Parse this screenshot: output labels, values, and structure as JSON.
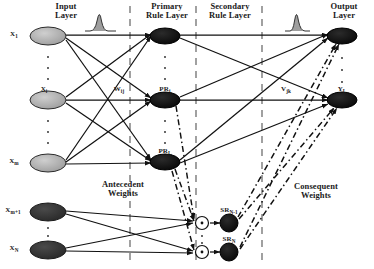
{
  "figure": {
    "type": "neural-network-architecture-diagram",
    "background": "#ffffff",
    "ink": "#111111",
    "size": {
      "width": 374,
      "height": 269
    }
  },
  "layer_titles": [
    {
      "id": "input",
      "label": "Input\nLayer",
      "x": 66,
      "y": 3
    },
    {
      "id": "primary-rule",
      "label": "Primary\nRule Layer",
      "x": 167,
      "y": 3
    },
    {
      "id": "secondary-rule",
      "label": "Secondary\nRule Layer",
      "x": 228,
      "y": 3
    },
    {
      "id": "output",
      "label": "Output\nLayer",
      "x": 344,
      "y": 3
    }
  ],
  "group_labels": [
    {
      "id": "antecedent-weights",
      "label": "Antecedent\nWeights",
      "x": 122,
      "y": 186
    },
    {
      "id": "consequent-weights",
      "label": "Consequent\nWeights",
      "x": 315,
      "y": 187
    }
  ],
  "weight_labels": [
    {
      "id": "w-ij",
      "base": "W",
      "sub": "ij",
      "x": 118,
      "y": 90
    },
    {
      "id": "v-jk",
      "base": "V",
      "sub": "jk",
      "x": 285,
      "y": 90
    }
  ],
  "nodes": {
    "input": [
      {
        "id": "x1",
        "base": "X",
        "sub": "1",
        "cx": 48,
        "cy": 36,
        "fill": "#a8a8a8"
      },
      {
        "id": "xi",
        "base": "X",
        "sub": "i",
        "cx": 48,
        "cy": 100,
        "fill": "#a8a8a8"
      },
      {
        "id": "xm",
        "base": "X",
        "sub": "m",
        "cx": 48,
        "cy": 163,
        "fill": "#a8a8a8"
      },
      {
        "id": "xm1",
        "base": "X",
        "sub": "m+1",
        "cx": 48,
        "cy": 212,
        "fill": "#3a3a3a"
      },
      {
        "id": "xn",
        "base": "X",
        "sub": "N",
        "cx": 48,
        "cy": 250,
        "fill": "#3a3a3a"
      }
    ],
    "primary_rule": [
      {
        "id": "pr1",
        "base": "PR",
        "sub": "1",
        "cx": 165,
        "cy": 36,
        "fill": "#0d0d0d",
        "label_shown": false
      },
      {
        "id": "prj",
        "base": "PR",
        "sub": "j",
        "cx": 165,
        "cy": 100,
        "fill": "#0d0d0d",
        "label_shown": true
      },
      {
        "id": "prl",
        "base": "PR",
        "sub": "L",
        "cx": 165,
        "cy": 162,
        "fill": "#0d0d0d",
        "label_shown": true
      }
    ],
    "product_operators": [
      {
        "id": "prod1",
        "cx": 202,
        "cy": 223,
        "glyph": "*"
      },
      {
        "id": "prod2",
        "cx": 202,
        "cy": 252,
        "glyph": "*"
      }
    ],
    "secondary_rule": [
      {
        "id": "srn1",
        "base": "SR",
        "sub": "N-1",
        "cx": 229,
        "cy": 223,
        "fill": "#0d0d0d"
      },
      {
        "id": "srn",
        "base": "SR",
        "sub": "N",
        "cx": 229,
        "cy": 252,
        "fill": "#0d0d0d"
      }
    ],
    "output": [
      {
        "id": "y1",
        "base": "Y",
        "sub": "1",
        "cx": 342,
        "cy": 36,
        "fill": "#0d0d0d",
        "label_shown": false
      },
      {
        "id": "yl",
        "base": "Y",
        "sub": "L",
        "cx": 342,
        "cy": 100,
        "fill": "#0d0d0d",
        "label_shown": true
      }
    ]
  },
  "dividers": [
    {
      "id": "divider-1",
      "x": 130
    },
    {
      "id": "divider-2",
      "x": 196
    },
    {
      "id": "divider-3",
      "x": 262
    }
  ],
  "bell_curves": [
    {
      "id": "bell-left",
      "cx": 100,
      "base_y": 31,
      "width": 30,
      "height": 22
    },
    {
      "id": "bell-right",
      "cx": 296,
      "base_y": 31,
      "width": 26,
      "height": 22
    }
  ],
  "vertical_ellipses": [
    {
      "id": "dots-input-1",
      "x": 48,
      "y1": 52,
      "y2": 84
    },
    {
      "id": "dots-input-2",
      "x": 48,
      "y1": 116,
      "y2": 148
    },
    {
      "id": "dots-input-3",
      "x": 48,
      "y1": 228,
      "y2": 240
    },
    {
      "id": "dots-pr-1",
      "x": 165,
      "y1": 52,
      "y2": 84
    },
    {
      "id": "dots-pr-2",
      "x": 165,
      "y1": 116,
      "y2": 148
    },
    {
      "id": "dots-pr-3",
      "x": 165,
      "y1": 174,
      "y2": 186
    },
    {
      "id": "dots-out-1",
      "x": 342,
      "y1": 52,
      "y2": 88
    },
    {
      "id": "dots-out-2",
      "x": 342,
      "y1": 112,
      "y2": 128
    }
  ],
  "edge_styles": {
    "solid": {
      "name": "solid-connection",
      "color": "#111111",
      "width": 1.2
    },
    "dashdot": {
      "name": "dash-dot-connection",
      "color": "#111111",
      "width": 1.5,
      "dash": "6,3,1.5,3"
    }
  }
}
